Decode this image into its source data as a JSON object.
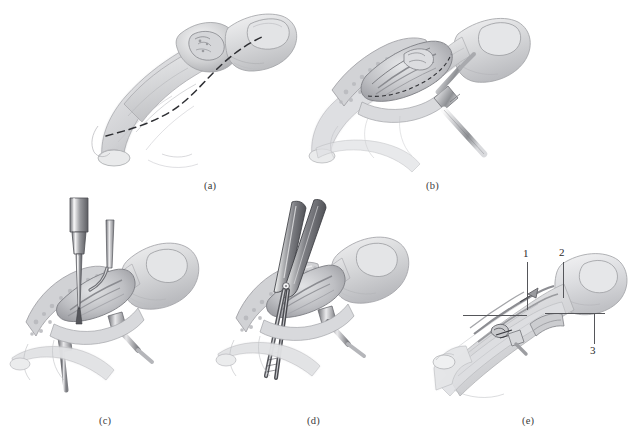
{
  "figure": {
    "background_color": "#ffffff",
    "ink_color": "#55565a",
    "label_color": "#3b3b3b",
    "width": 638,
    "height": 444
  },
  "panels": [
    {
      "id": "a",
      "label": "(a)",
      "description": "Finger in lateral view with dashed curvilinear incision line marked over the digit",
      "content": "dashed-incision-outline"
    },
    {
      "id": "b",
      "label": "(b)",
      "description": "Skin flap raised and wound held open by a retractor, exposing underlying tissue",
      "content": "open-wound-retractor"
    },
    {
      "id": "c",
      "label": "(c)",
      "description": "Two vertical instruments introduced into the operative field while retractors hold the flap",
      "content": "instruments-inserted"
    },
    {
      "id": "d",
      "label": "(d)",
      "description": "Scissors and forceps dissecting within the exposed wound",
      "content": "scissors-dissection"
    },
    {
      "id": "e",
      "label": "(e)",
      "description": "Final exposure with three numbered anatomical structures indicated by leader lines",
      "content": "labeled-anatomy"
    }
  ],
  "callouts": [
    {
      "number": "1",
      "panel": "e"
    },
    {
      "number": "2",
      "panel": "e"
    },
    {
      "number": "3",
      "panel": "e"
    }
  ],
  "bottom_caption": {
    "text": "",
    "visible": false
  }
}
